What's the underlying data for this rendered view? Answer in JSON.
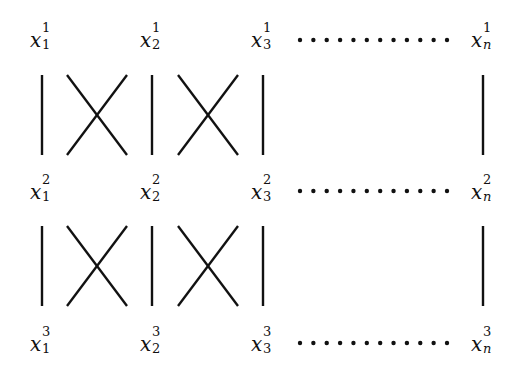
{
  "diagram": {
    "type": "braid-permutation-diagram",
    "levels": [
      {
        "superscript": "1",
        "labels": [
          "1",
          "2",
          "3",
          "n"
        ],
        "base": "x"
      },
      {
        "superscript": "2",
        "labels": [
          "1",
          "2",
          "3",
          "n"
        ],
        "base": "x"
      },
      {
        "superscript": "3",
        "labels": [
          "1",
          "2",
          "3",
          "n"
        ],
        "base": "x"
      }
    ],
    "ellipsis_dots_per_row": 12,
    "between_levels": [
      {
        "from": 1,
        "to": 2,
        "segments": [
          "vertical",
          "cross",
          "vertical",
          "cross",
          "vertical",
          "gap",
          "vertical"
        ]
      },
      {
        "from": 2,
        "to": 3,
        "segments": [
          "vertical",
          "cross",
          "vertical",
          "cross",
          "vertical",
          "gap",
          "vertical"
        ]
      }
    ],
    "colors": {
      "stroke": "#111111",
      "background": "#ffffff"
    }
  }
}
